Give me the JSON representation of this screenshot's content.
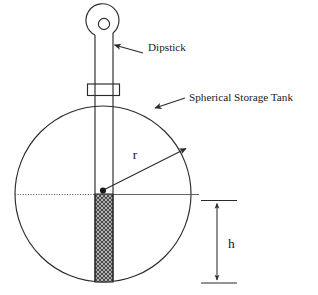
{
  "figure": {
    "title_visible": false,
    "background_color": "#ffffff",
    "line_color": "#2b2b2b",
    "fill_color": "#8a8a8a"
  },
  "labels": {
    "dipstick": "Dipstick",
    "tank": "Spherical Storage Tank",
    "radius_symbol": "r",
    "height_symbol": "h"
  },
  "geometry": {
    "tank_center_x": 103,
    "tank_center_y": 194,
    "tank_radius": 88,
    "liquid_height_label": "h",
    "radius_label": "r"
  },
  "parts": [
    {
      "name": "dipstick-handle-loop",
      "shape": "rounded-loop-with-hole"
    },
    {
      "name": "dipstick-stem",
      "shape": "vertical-bar"
    },
    {
      "name": "dipstick-collar",
      "shape": "rectangle"
    },
    {
      "name": "spherical-tank",
      "shape": "circle"
    },
    {
      "name": "liquid-wetted-region",
      "shape": "hatched-rectangle"
    },
    {
      "name": "center-line",
      "shape": "horizontal-dotted-line"
    },
    {
      "name": "radius-arrow",
      "shape": "arrow"
    },
    {
      "name": "height-dimension",
      "shape": "double-arrow"
    }
  ]
}
